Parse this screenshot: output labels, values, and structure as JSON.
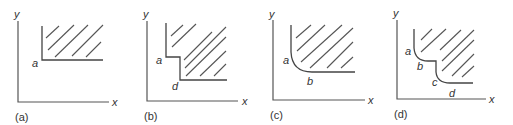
{
  "figure": {
    "panels": [
      {
        "id": "a",
        "caption": "(a)",
        "axis_x_label": "x",
        "axis_y_label": "y",
        "boundary_labels": [
          "a"
        ],
        "description": "Shaded feasible region bounded by a right-angle corner"
      },
      {
        "id": "b",
        "caption": "(b)",
        "axis_x_label": "x",
        "axis_y_label": "y",
        "boundary_labels": [
          "a",
          "d"
        ],
        "description": "Shaded region with stepped boundary (two corners)"
      },
      {
        "id": "c",
        "caption": "(c)",
        "axis_x_label": "x",
        "axis_y_label": "y",
        "boundary_labels": [
          "a",
          "b"
        ],
        "description": "Shaded region with smoothly curved corner"
      },
      {
        "id": "d",
        "caption": "(d)",
        "axis_x_label": "x",
        "axis_y_label": "y",
        "boundary_labels": [
          "a",
          "b",
          "c",
          "d"
        ],
        "description": "Shaded region with stepped boundary having rounded corners"
      }
    ]
  }
}
